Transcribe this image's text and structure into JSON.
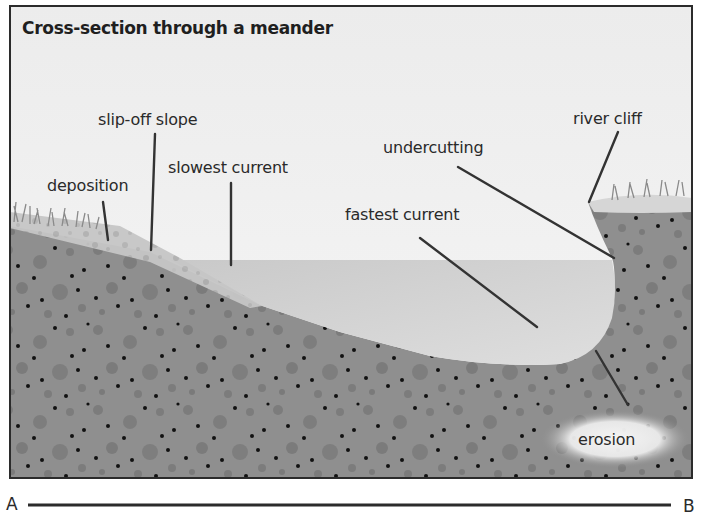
{
  "title": "Cross-section through a meander",
  "labels": {
    "slip_off_slope": "slip-off slope",
    "slowest_current": "slowest current",
    "deposition": "deposition",
    "fastest_current": "fastest current",
    "undercutting": "undercutting",
    "river_cliff": "river cliff",
    "erosion": "erosion"
  },
  "axis": {
    "start": "A",
    "end": "B"
  },
  "colors": {
    "sky": "#f0f0f0",
    "water_surface": "#cfcfcf",
    "water_deep": "#dcdcdc",
    "ground": "#8f8f8f",
    "ground_pebble": "#7a7a7a",
    "pebble_dark": "#111111",
    "deposit": "#c4c4c4",
    "grass": "#8a8a8a",
    "frame": "#2b2b2b",
    "leader_line": "#333333"
  }
}
